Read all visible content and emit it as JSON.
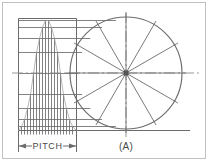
{
  "figure": {
    "label": "(A)",
    "dimension_label": "PITCH",
    "colors": {
      "line": "#6b6b6b",
      "line_light": "#9a9a9a",
      "center_line": "#8a8a8a",
      "hub": "#555555",
      "text": "#4a4a4a",
      "frame": "#b8b8b8",
      "background": "#ffffff"
    }
  },
  "circle_view": {
    "name": "end-view-circle",
    "center": {
      "x": 126,
      "y": 73
    },
    "radius": 56,
    "divisions": 12,
    "spoke_angles_deg": [
      0,
      30,
      60,
      90,
      120,
      150,
      180,
      210,
      240,
      270,
      300,
      330
    ],
    "tick_overshoot": 4,
    "hub_size": 5
  },
  "profile_view": {
    "name": "pitch-development-profile",
    "frame": {
      "x": 18,
      "y": 18,
      "width": 58,
      "height": 112
    },
    "baseline_y": 130,
    "axis_y": 73,
    "projection_lines_y": [
      20,
      27,
      38,
      52,
      73,
      94,
      108,
      119,
      126
    ],
    "vertical_ordinates_x": [
      18,
      21,
      24,
      27,
      30,
      33,
      36,
      39,
      42,
      45,
      48,
      51,
      54,
      57,
      60,
      63,
      66,
      69,
      72,
      76
    ],
    "step_tops_y": [
      130,
      126,
      119,
      108,
      94,
      73,
      52,
      38,
      27,
      20,
      20,
      27,
      38,
      52,
      73,
      94,
      108,
      119,
      126,
      130
    ]
  },
  "dimension": {
    "name": "pitch-dimension",
    "label": "PITCH",
    "line_y": 146,
    "from_x": 18,
    "to_x": 76,
    "extension_top_y": 131,
    "extension_bottom_y": 152
  },
  "frame_border": {
    "x": 2,
    "y": 2,
    "width": 204,
    "height": 157
  }
}
